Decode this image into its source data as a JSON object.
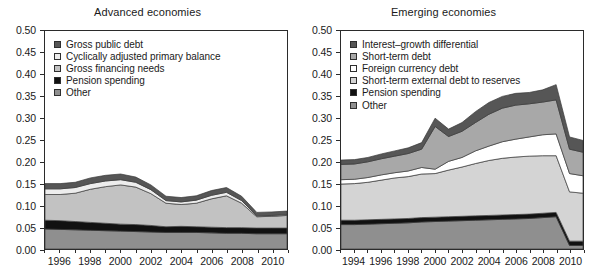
{
  "figure": {
    "width": 591,
    "height": 277,
    "background": "#ffffff"
  },
  "panels": [
    {
      "id": "advanced",
      "title": "Advanced economies",
      "y_ticks": [
        "0.00",
        "0.05",
        "0.10",
        "0.15",
        "0.20",
        "0.25",
        "0.30",
        "0.35",
        "0.40",
        "0.45",
        "0.50"
      ],
      "x_ticks": [
        "1996",
        "1998",
        "2000",
        "2002",
        "2004",
        "2006",
        "2008",
        "2010"
      ],
      "legend": [
        {
          "label": "Gross public debt",
          "color": "#565656"
        },
        {
          "label": "Cyclically adjusted primary balance",
          "color": "#ededed"
        },
        {
          "label": "Gross financing needs",
          "color": "#c2c2c2"
        },
        {
          "label": "Pension spending",
          "color": "#111111"
        },
        {
          "label": "Other",
          "color": "#8f8f8f"
        }
      ]
    },
    {
      "id": "emerging",
      "title": "Emerging economies",
      "y_ticks": [
        "0.00",
        "0.05",
        "0.10",
        "0.15",
        "0.20",
        "0.25",
        "0.30",
        "0.35",
        "0.40",
        "0.45",
        "0.50"
      ],
      "x_ticks": [
        "1994",
        "1996",
        "1998",
        "2000",
        "2002",
        "2004",
        "2006",
        "2008",
        "2010"
      ],
      "legend": [
        {
          "label": "Interest–growth differential",
          "color": "#565656"
        },
        {
          "label": "Short-term debt",
          "color": "#a8a8a8"
        },
        {
          "label": "Foreign currency debt",
          "color": "#ffffff"
        },
        {
          "label": "Short-term external debt to reserves",
          "color": "#d4d4d4"
        },
        {
          "label": "Pension spending",
          "color": "#111111"
        },
        {
          "label": "Other",
          "color": "#8f8f8f"
        }
      ]
    }
  ],
  "chart_data": [
    {
      "type": "area",
      "stacked": true,
      "title": "Advanced economies",
      "xlabel": "",
      "ylabel": "",
      "ylim": [
        0,
        0.5
      ],
      "xlim": [
        1995,
        2011
      ],
      "grid": false,
      "legend_position": "top-left inside",
      "x": [
        1995,
        1996,
        1997,
        1998,
        1999,
        2000,
        2001,
        2002,
        2003,
        2004,
        2005,
        2006,
        2007,
        2008,
        2009,
        2010,
        2011
      ],
      "series": [
        {
          "name": "Other",
          "color": "#8f8f8f",
          "values": [
            0.046,
            0.045,
            0.044,
            0.043,
            0.042,
            0.041,
            0.04,
            0.039,
            0.038,
            0.038,
            0.038,
            0.037,
            0.036,
            0.036,
            0.035,
            0.035,
            0.035
          ]
        },
        {
          "name": "Pension spending",
          "color": "#111111",
          "values": [
            0.02,
            0.02,
            0.019,
            0.018,
            0.017,
            0.016,
            0.016,
            0.015,
            0.013,
            0.014,
            0.013,
            0.013,
            0.013,
            0.013,
            0.013,
            0.013,
            0.013
          ]
        },
        {
          "name": "Gross financing needs",
          "color": "#c2c2c2",
          "values": [
            0.059,
            0.06,
            0.065,
            0.076,
            0.084,
            0.09,
            0.086,
            0.073,
            0.054,
            0.05,
            0.054,
            0.065,
            0.073,
            0.056,
            0.026,
            0.027,
            0.029
          ]
        },
        {
          "name": "Cyclically adjusted primary balance",
          "color": "#ededed",
          "values": [
            0.013,
            0.013,
            0.013,
            0.013,
            0.013,
            0.012,
            0.011,
            0.009,
            0.006,
            0.006,
            0.007,
            0.008,
            0.008,
            0.006,
            0.002,
            0.002,
            0.002
          ]
        },
        {
          "name": "Gross public debt",
          "color": "#565656",
          "values": [
            0.012,
            0.012,
            0.012,
            0.013,
            0.013,
            0.013,
            0.012,
            0.011,
            0.01,
            0.01,
            0.01,
            0.011,
            0.011,
            0.01,
            0.008,
            0.008,
            0.008
          ]
        }
      ],
      "totals": [
        0.15,
        0.15,
        0.153,
        0.163,
        0.169,
        0.172,
        0.165,
        0.147,
        0.121,
        0.118,
        0.122,
        0.134,
        0.141,
        0.121,
        0.084,
        0.085,
        0.087
      ]
    },
    {
      "type": "area",
      "stacked": true,
      "title": "Emerging economies",
      "xlabel": "",
      "ylabel": "",
      "ylim": [
        0,
        0.5
      ],
      "xlim": [
        1993,
        2011
      ],
      "grid": false,
      "legend_position": "top-left inside",
      "x": [
        1993,
        1994,
        1995,
        1996,
        1997,
        1998,
        1999,
        2000,
        2001,
        2002,
        2003,
        2004,
        2005,
        2006,
        2007,
        2008,
        2009,
        2010,
        2011
      ],
      "series": [
        {
          "name": "Other",
          "color": "#8f8f8f",
          "values": [
            0.056,
            0.056,
            0.057,
            0.058,
            0.059,
            0.06,
            0.062,
            0.063,
            0.064,
            0.065,
            0.066,
            0.067,
            0.068,
            0.069,
            0.07,
            0.072,
            0.074,
            0.008,
            0.008
          ]
        },
        {
          "name": "Pension spending",
          "color": "#111111",
          "values": [
            0.01,
            0.01,
            0.01,
            0.01,
            0.01,
            0.01,
            0.01,
            0.01,
            0.01,
            0.01,
            0.01,
            0.01,
            0.01,
            0.01,
            0.01,
            0.01,
            0.01,
            0.01,
            0.01
          ]
        },
        {
          "name": "Short-term external debt to reserves",
          "color": "#d4d4d4",
          "values": [
            0.083,
            0.084,
            0.086,
            0.09,
            0.094,
            0.096,
            0.1,
            0.1,
            0.107,
            0.113,
            0.12,
            0.126,
            0.13,
            0.132,
            0.133,
            0.132,
            0.13,
            0.113,
            0.11
          ]
        },
        {
          "name": "Foreign currency debt",
          "color": "#ffffff",
          "values": [
            0.01,
            0.01,
            0.011,
            0.012,
            0.012,
            0.013,
            0.015,
            0.01,
            0.02,
            0.022,
            0.029,
            0.033,
            0.038,
            0.041,
            0.044,
            0.048,
            0.05,
            0.042,
            0.04
          ]
        },
        {
          "name": "Short-term debt",
          "color": "#a8a8a8",
          "values": [
            0.035,
            0.035,
            0.036,
            0.037,
            0.038,
            0.04,
            0.042,
            0.098,
            0.057,
            0.06,
            0.065,
            0.073,
            0.077,
            0.078,
            0.076,
            0.075,
            0.078,
            0.056,
            0.054
          ]
        },
        {
          "name": "Interest–growth differential",
          "color": "#565656",
          "values": [
            0.01,
            0.01,
            0.01,
            0.011,
            0.012,
            0.013,
            0.015,
            0.019,
            0.017,
            0.02,
            0.025,
            0.027,
            0.027,
            0.027,
            0.026,
            0.028,
            0.035,
            0.028,
            0.027
          ]
        }
      ],
      "totals": [
        0.204,
        0.205,
        0.21,
        0.218,
        0.225,
        0.232,
        0.244,
        0.3,
        0.275,
        0.29,
        0.315,
        0.336,
        0.35,
        0.357,
        0.359,
        0.365,
        0.377,
        0.257,
        0.249
      ]
    }
  ]
}
